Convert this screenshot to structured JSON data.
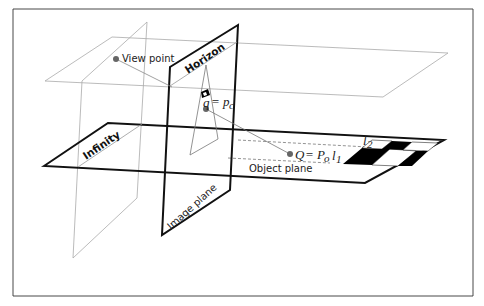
{
  "diagram": {
    "labels": {
      "view_point": "View point",
      "horizon": "Horizon",
      "infinity": "Infinity",
      "image_plane": "Image plane",
      "object_plane": "Object plane",
      "q_eq": "q",
      "q_rhs": "= p",
      "q_sub": "c",
      "Q_eq": "Q",
      "Q_rhs": "= P",
      "Q_sub": "o",
      "l1": "l",
      "l1_sub": "1",
      "l2": "l",
      "l2_sub": "2"
    },
    "colors": {
      "border": "#333333",
      "heavy_line": "#111111",
      "light_line": "#aaaaaa",
      "point": "#666666",
      "checker": "#000000"
    }
  }
}
